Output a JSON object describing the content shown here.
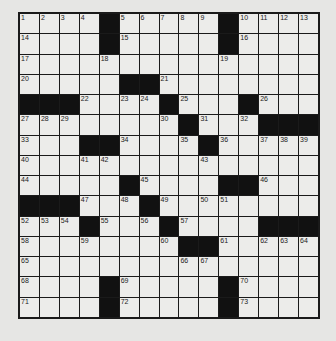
{
  "puzzle": {
    "size": 15,
    "grid": [
      "....#.....#....",
      "....#.....#....",
      "...............",
      ".....##........",
      "###....#...#...",
      "........#...###",
      "...##....#.....",
      "...............",
      ".....#....##...",
      "###...#........",
      "...#...#....###",
      "........##.....",
      "...............",
      "....#.....#....",
      "....#.....#...."
    ],
    "numbers": [
      [
        1,
        2,
        3,
        4,
        0,
        5,
        6,
        7,
        8,
        9,
        0,
        10,
        11,
        12,
        13
      ],
      [
        14,
        0,
        0,
        0,
        0,
        15,
        0,
        0,
        0,
        0,
        0,
        16,
        0,
        0,
        0
      ],
      [
        17,
        0,
        0,
        0,
        18,
        0,
        0,
        0,
        0,
        0,
        19,
        0,
        0,
        0,
        0
      ],
      [
        20,
        0,
        0,
        0,
        0,
        0,
        0,
        21,
        0,
        0,
        0,
        0,
        0,
        0,
        0
      ],
      [
        0,
        0,
        0,
        22,
        0,
        23,
        24,
        0,
        25,
        0,
        0,
        0,
        26,
        0,
        0
      ],
      [
        27,
        28,
        29,
        0,
        0,
        0,
        0,
        30,
        0,
        31,
        0,
        32,
        0,
        0,
        0
      ],
      [
        33,
        0,
        0,
        0,
        0,
        34,
        0,
        0,
        35,
        0,
        36,
        0,
        37,
        38,
        39
      ],
      [
        40,
        0,
        0,
        41,
        42,
        0,
        0,
        0,
        0,
        43,
        0,
        0,
        0,
        0,
        0
      ],
      [
        44,
        0,
        0,
        0,
        0,
        0,
        45,
        0,
        0,
        0,
        0,
        0,
        46,
        0,
        0
      ],
      [
        0,
        0,
        0,
        47,
        0,
        48,
        0,
        49,
        0,
        50,
        51,
        0,
        0,
        0,
        0
      ],
      [
        52,
        53,
        54,
        0,
        55,
        0,
        56,
        0,
        57,
        0,
        0,
        0,
        0,
        0,
        0
      ],
      [
        58,
        0,
        0,
        59,
        0,
        0,
        0,
        60,
        0,
        0,
        61,
        0,
        62,
        63,
        64
      ],
      [
        65,
        0,
        0,
        0,
        0,
        0,
        0,
        0,
        66,
        67,
        0,
        0,
        0,
        0,
        0
      ],
      [
        68,
        0,
        0,
        0,
        0,
        69,
        0,
        0,
        0,
        0,
        0,
        70,
        0,
        0,
        0
      ],
      [
        71,
        0,
        0,
        0,
        0,
        72,
        0,
        0,
        0,
        0,
        0,
        73,
        0,
        0,
        0
      ]
    ]
  }
}
